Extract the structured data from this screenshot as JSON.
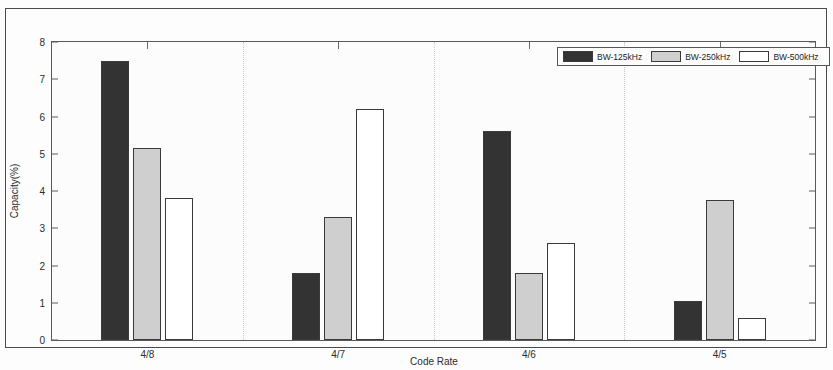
{
  "chart_data": {
    "type": "bar",
    "title": "",
    "xlabel": "Code Rate",
    "ylabel": "Capacity(%)",
    "categories": [
      "4/8",
      "4/7",
      "4/6",
      "4/5"
    ],
    "series": [
      {
        "name": "BW-125kHz",
        "color": "#333333",
        "values": [
          7.5,
          1.8,
          5.6,
          1.05
        ]
      },
      {
        "name": "BW-250kHz",
        "color": "#cfcfcf",
        "values": [
          5.15,
          3.3,
          1.8,
          3.75
        ]
      },
      {
        "name": "BW-500kHz",
        "color": "#ffffff",
        "values": [
          3.8,
          6.2,
          2.6,
          0.6
        ]
      }
    ],
    "ylim": [
      0,
      8
    ],
    "yticks": [
      0,
      1,
      2,
      3,
      4,
      5,
      6,
      7,
      8
    ],
    "ytick_labels": [
      "0",
      "1",
      "2",
      "3",
      "4",
      "5",
      "6",
      "7",
      "8"
    ],
    "grid": false,
    "legend_position": "top-right"
  },
  "legend": {
    "entries": [
      {
        "label": "BW-125kHz"
      },
      {
        "label": "BW-250kHz"
      },
      {
        "label": "BW-500kHz"
      }
    ]
  }
}
